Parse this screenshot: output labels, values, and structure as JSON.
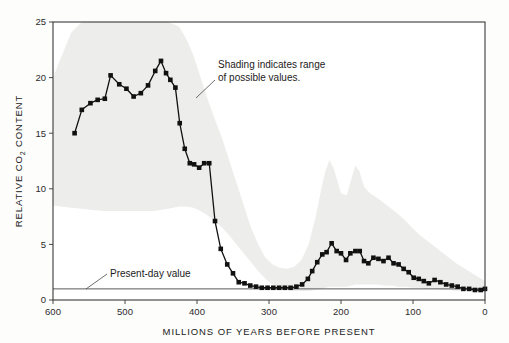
{
  "chart_data": {
    "type": "line",
    "title": "",
    "xlabel": "MILLIONS OF YEARS BEFORE PRESENT",
    "ylabel": "RELATIVE CO2 CONTENT",
    "ylabel_parts": {
      "pre": "RELATIVE CO",
      "sub": "2",
      "post": " CONTENT"
    },
    "xlim": [
      600,
      0
    ],
    "ylim": [
      0,
      25
    ],
    "x_reversed": true,
    "grid": false,
    "legend": null,
    "xticks": [
      600,
      500,
      400,
      300,
      200,
      100,
      0
    ],
    "yticks": [
      0,
      5,
      10,
      15,
      20,
      25
    ],
    "xtick_labels": [
      "600",
      "500",
      "400",
      "300",
      "200",
      "100",
      "0"
    ],
    "ytick_labels": [
      "0",
      "5",
      "10",
      "15",
      "20",
      "25"
    ],
    "series": [
      {
        "name": "Relative CO2 content",
        "marker": "filled-square",
        "x": [
          570,
          560,
          548,
          538,
          528,
          520,
          508,
          498,
          488,
          478,
          468,
          458,
          450,
          443,
          437,
          430,
          424,
          417,
          410,
          404,
          397,
          390,
          383,
          375,
          367,
          358,
          350,
          342,
          334,
          326,
          318,
          310,
          302,
          294,
          286,
          278,
          270,
          262,
          254,
          246,
          240,
          233,
          226,
          220,
          213,
          206,
          200,
          193,
          187,
          180,
          174,
          168,
          162,
          155,
          148,
          141,
          134,
          127,
          120,
          113,
          106,
          99,
          92,
          85,
          78,
          70,
          62,
          54,
          46,
          38,
          30,
          22,
          14,
          6,
          0
        ],
        "y": [
          15.0,
          17.1,
          17.7,
          18.0,
          18.1,
          20.2,
          19.4,
          19.0,
          18.3,
          18.6,
          19.3,
          20.6,
          21.5,
          20.4,
          19.8,
          19.1,
          15.9,
          13.6,
          12.3,
          12.2,
          11.9,
          12.3,
          12.3,
          7.1,
          4.6,
          3.2,
          2.4,
          1.6,
          1.5,
          1.3,
          1.2,
          1.1,
          1.1,
          1.1,
          1.1,
          1.1,
          1.1,
          1.2,
          1.4,
          1.9,
          2.6,
          3.4,
          4.1,
          4.3,
          5.1,
          4.4,
          4.2,
          3.6,
          4.2,
          4.4,
          4.4,
          3.5,
          3.3,
          3.8,
          3.7,
          3.5,
          3.8,
          3.3,
          3.2,
          2.8,
          2.5,
          2.0,
          1.9,
          1.7,
          1.5,
          1.8,
          1.6,
          1.4,
          1.3,
          1.2,
          1.0,
          1.0,
          0.9,
          0.9,
          1.0
        ]
      }
    ],
    "reference_line": {
      "name": "Present-day value",
      "y": 1.0,
      "orientation": "horizontal"
    },
    "band": {
      "name": "Range of possible values",
      "x": [
        600,
        575,
        560,
        545,
        530,
        515,
        500,
        480,
        460,
        440,
        425,
        415,
        405,
        395,
        385,
        375,
        365,
        355,
        345,
        335,
        325,
        315,
        305,
        295,
        285,
        275,
        265,
        255,
        245,
        235,
        228,
        222,
        216,
        210,
        200,
        192,
        186,
        180,
        174,
        168,
        160,
        150,
        140,
        130,
        120,
        110,
        100,
        90,
        80,
        70,
        60,
        50,
        40,
        30,
        20,
        10,
        0
      ],
      "upper": [
        20.0,
        24.0,
        25.0,
        25.0,
        25.0,
        25.0,
        25.0,
        25.0,
        25.0,
        25.0,
        24.6,
        23.5,
        22.0,
        20.0,
        18.0,
        16.2,
        14.5,
        12.5,
        10.5,
        8.5,
        6.5,
        5.0,
        3.8,
        3.2,
        2.9,
        2.8,
        3.0,
        3.6,
        5.0,
        7.5,
        9.8,
        11.5,
        12.6,
        11.8,
        9.6,
        9.4,
        10.8,
        12.1,
        11.5,
        10.2,
        9.6,
        9.2,
        8.7,
        8.2,
        7.7,
        7.1,
        6.4,
        5.8,
        5.3,
        4.8,
        4.3,
        3.8,
        3.3,
        2.9,
        2.5,
        2.1,
        1.7
      ],
      "lower": [
        8.5,
        8.3,
        8.2,
        8.1,
        8.0,
        8.0,
        8.0,
        8.0,
        8.0,
        8.2,
        8.4,
        8.4,
        8.3,
        8.0,
        7.6,
        7.1,
        6.5,
        5.8,
        5.0,
        4.2,
        3.4,
        2.6,
        1.9,
        1.4,
        1.1,
        0.9,
        0.8,
        0.8,
        0.8,
        0.9,
        1.0,
        1.1,
        1.2,
        1.2,
        1.2,
        1.2,
        1.3,
        1.4,
        1.4,
        1.4,
        1.4,
        1.4,
        1.3,
        1.3,
        1.2,
        1.2,
        1.1,
        1.1,
        1.0,
        1.0,
        0.9,
        0.9,
        0.8,
        0.8,
        0.8,
        0.7,
        0.7
      ]
    },
    "annotations": [
      {
        "id": "shading-note",
        "line1": "Shading indicates range",
        "line2": "of possible values."
      },
      {
        "id": "present-day-note",
        "text": "Present-day value"
      }
    ],
    "colors": {
      "page_background": "#fdfdfc",
      "plot_background": "#ffffff",
      "band_fill": "#ededec",
      "line": "#111111",
      "marker": "#111111",
      "axis": "#4a4a4a",
      "frame": "#3a3a3a",
      "text": "#1b1b1b",
      "reference_line": "#5a5a5a"
    }
  }
}
